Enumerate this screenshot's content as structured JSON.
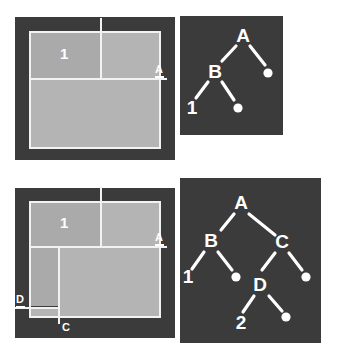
{
  "figure": {
    "colors": {
      "panel_background": "#3b3b3b",
      "region_fill": "#b4b4b4",
      "region_fill_alt": "#aaaaaa",
      "line": "#f2f2f2",
      "label": "#ffffff",
      "page_background": "#ffffff"
    }
  },
  "rows": [
    {
      "id": "row-top",
      "partition": {
        "name": "partition-diagram-top",
        "cut_labels": [
          {
            "id": "cut-a-top",
            "text": "A",
            "orientation": "horizontal",
            "underlined": true
          },
          {
            "id": "cut-b-top",
            "text": "B",
            "orientation": "vertical",
            "underlined": false
          }
        ],
        "region_labels": [
          {
            "id": "region-1-top",
            "text": "1"
          }
        ]
      },
      "tree": {
        "name": "bsp-tree-top",
        "nodes": [
          {
            "id": "t1-A",
            "label": "A",
            "type": "internal",
            "x": 62,
            "y": 20
          },
          {
            "id": "t1-B",
            "label": "B",
            "type": "internal",
            "x": 35,
            "y": 55
          },
          {
            "id": "t1-r1",
            "label": "",
            "type": "leaf-dot",
            "x": 88,
            "y": 57
          },
          {
            "id": "t1-1",
            "label": "1",
            "type": "leaf-num",
            "x": 12,
            "y": 92
          },
          {
            "id": "t1-d2",
            "label": "",
            "type": "leaf-dot",
            "x": 57,
            "y": 94
          }
        ],
        "edges": [
          {
            "from": "t1-A",
            "to": "t1-B"
          },
          {
            "from": "t1-A",
            "to": "t1-r1"
          },
          {
            "from": "t1-B",
            "to": "t1-1"
          },
          {
            "from": "t1-B",
            "to": "t1-d2"
          }
        ]
      }
    },
    {
      "id": "row-bottom",
      "partition": {
        "name": "partition-diagram-bottom",
        "cut_labels": [
          {
            "id": "cut-a-bot",
            "text": "A",
            "orientation": "horizontal",
            "underlined": true
          },
          {
            "id": "cut-b-bot",
            "text": "B",
            "orientation": "vertical",
            "underlined": false
          },
          {
            "id": "cut-c-bot",
            "text": "C",
            "orientation": "vertical",
            "underlined": false
          },
          {
            "id": "cut-d-bot",
            "text": "D",
            "orientation": "horizontal",
            "underlined": true
          }
        ],
        "region_labels": [
          {
            "id": "region-1-bot",
            "text": "1"
          }
        ]
      },
      "tree": {
        "name": "bsp-tree-bottom",
        "nodes": [
          {
            "id": "t2-A",
            "label": "A",
            "type": "internal",
            "x": 60,
            "y": 18
          },
          {
            "id": "t2-B",
            "label": "B",
            "type": "internal",
            "x": 30,
            "y": 58
          },
          {
            "id": "t2-C",
            "label": "C",
            "type": "internal",
            "x": 100,
            "y": 58
          },
          {
            "id": "t2-1",
            "label": "1",
            "type": "leaf-num",
            "x": 7,
            "y": 98
          },
          {
            "id": "t2-d1",
            "label": "",
            "type": "leaf-dot",
            "x": 56,
            "y": 99
          },
          {
            "id": "t2-D",
            "label": "D",
            "type": "internal",
            "x": 78,
            "y": 101
          },
          {
            "id": "t2-d2",
            "label": "",
            "type": "leaf-dot",
            "x": 124,
            "y": 99
          },
          {
            "id": "t2-2",
            "label": "2",
            "type": "leaf-num",
            "x": 62,
            "y": 142
          },
          {
            "id": "t2-d3",
            "label": "",
            "type": "leaf-dot",
            "x": 106,
            "y": 138
          }
        ],
        "edges": [
          {
            "from": "t2-A",
            "to": "t2-B"
          },
          {
            "from": "t2-A",
            "to": "t2-C"
          },
          {
            "from": "t2-B",
            "to": "t2-1"
          },
          {
            "from": "t2-B",
            "to": "t2-d1"
          },
          {
            "from": "t2-C",
            "to": "t2-D"
          },
          {
            "from": "t2-C",
            "to": "t2-d2"
          },
          {
            "from": "t2-D",
            "to": "t2-2"
          },
          {
            "from": "t2-D",
            "to": "t2-d3"
          }
        ]
      }
    }
  ]
}
